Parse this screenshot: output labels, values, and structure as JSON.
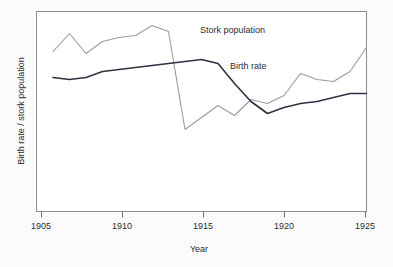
{
  "chart_data": {
    "type": "line",
    "title": "",
    "xlabel": "Year",
    "ylabel": "Birth rate / stork population",
    "xlim": [
      1905,
      1925
    ],
    "ylim": [
      0,
      100
    ],
    "xticks": [
      1905,
      1910,
      1915,
      1920,
      1925
    ],
    "xtick_labels": [
      "1905",
      "1910",
      "1915",
      "1920",
      "1925"
    ],
    "yticks": [],
    "ytick_labels": [],
    "grid": false,
    "legend_position": "inline-annotations",
    "series": [
      {
        "name": "Stork population",
        "color": "#9a9aa4",
        "annotation": "Stork population",
        "x": [
          1906,
          1907,
          1908,
          1909,
          1910,
          1911,
          1912,
          1913,
          1914,
          1915,
          1916,
          1917,
          1918,
          1919,
          1920,
          1921,
          1922,
          1923,
          1924,
          1925
        ],
        "values": [
          80,
          89,
          79,
          85,
          87,
          88,
          93,
          90,
          41,
          47,
          53,
          48,
          56,
          54,
          58,
          69,
          66,
          65,
          70,
          82
        ]
      },
      {
        "name": "Birth rate",
        "color": "#2e3140",
        "annotation": "Birth rate",
        "x": [
          1906,
          1907,
          1908,
          1909,
          1910,
          1911,
          1912,
          1913,
          1914,
          1915,
          1916,
          1917,
          1918,
          1919,
          1920,
          1921,
          1922,
          1923,
          1924,
          1925
        ],
        "values": [
          67,
          66,
          67,
          70,
          71,
          72,
          73,
          74,
          75,
          76,
          74,
          64,
          55,
          49,
          52,
          54,
          55,
          57,
          59,
          59
        ]
      }
    ],
    "annotations": [
      {
        "text": "Stork population",
        "x_px": 200,
        "y_px": 33
      },
      {
        "text": "Birth rate",
        "x_px": 230,
        "y_px": 69
      }
    ]
  },
  "axes": {
    "x_axis_name": "year-axis",
    "y_axis_name": "value-axis",
    "x_title": "Year",
    "y_title": "Birth rate / stork population"
  }
}
